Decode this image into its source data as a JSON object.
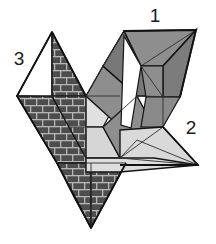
{
  "figure": {
    "background_color": "#ffffff",
    "width": 216,
    "height": 244,
    "outline_color": "#141414",
    "thin_line_color": "#3c3c3c",
    "labels": [
      {
        "id": "label-1",
        "text": "1",
        "x": 155,
        "y": 22
      },
      {
        "id": "label-2",
        "text": "2",
        "x": 191,
        "y": 134
      },
      {
        "id": "label-3",
        "text": "3",
        "x": 19,
        "y": 65
      }
    ],
    "palette": {
      "brick_fill": "#4a4a4a",
      "brick_mortar": "#b4b4b4",
      "mid_gray": "#8c8c8c",
      "dark_gray": "#767676",
      "light_gray": "#d9d9d9",
      "pale_gray": "#e4e4e4",
      "white": "#ffffff",
      "outline": "#141414"
    },
    "faces": [
      {
        "name": "face-left-white-triangle",
        "fill": "white",
        "points": "17,96 52,32 52,96"
      },
      {
        "name": "face-left-brick-triangle",
        "fill": "brick",
        "points": "52,32 86,96 52,96"
      },
      {
        "name": "face-left-lower-brick",
        "fill": "brick",
        "points": "17,96 52,96 91,164 57,164"
      },
      {
        "name": "face-left-pale-band",
        "fill": "pale",
        "points": "52,96 86,96 120,96 103,126 69,126"
      },
      {
        "name": "face-left-bottom-brick",
        "fill": "brick",
        "points": "57,164 91,164 91,228 74,196"
      },
      {
        "name": "face-left-bottom-brick-b",
        "fill": "brick",
        "points": "91,164 125,164 108,196 91,228"
      },
      {
        "name": "face-center-mid-upper",
        "fill": "mid",
        "points": "86,96 103,66 137,96 120,126"
      },
      {
        "name": "face-center-dark-vertical",
        "fill": "dark",
        "points": "103,66 124,31 158,96 137,96"
      },
      {
        "name": "face-center-mid-lower",
        "fill": "mid",
        "points": "103,126 137,96 154,126 120,158"
      },
      {
        "name": "face-center-light",
        "fill": "light",
        "points": "69,126 103,126 120,158 86,158"
      },
      {
        "name": "face-right-top-mid",
        "fill": "mid",
        "points": "124,31 196,30 162,66 141,66"
      },
      {
        "name": "face-right-upper-dark",
        "fill": "dark",
        "points": "162,66 196,30 179,96 162,96"
      },
      {
        "name": "face-right-mid",
        "fill": "mid",
        "points": "141,66 162,66 179,96 158,96"
      },
      {
        "name": "face-right-lower-mid",
        "fill": "mid",
        "points": "158,96 179,96 162,126 141,126"
      },
      {
        "name": "face-right-light-large",
        "fill": "light",
        "points": "137,126 198,165 120,165 120,130"
      },
      {
        "name": "face-right-pale-tri",
        "fill": "pale",
        "points": "162,126 198,165 137,140"
      },
      {
        "name": "face-bottom-light-band",
        "fill": "light",
        "points": "86,158 120,158 198,165 120,172 86,172"
      }
    ]
  }
}
